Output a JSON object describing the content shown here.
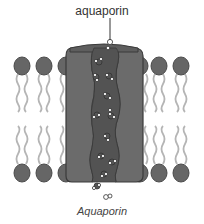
{
  "diagram": {
    "title_label": "aquaporin",
    "caption": "Aquaporin",
    "colors": {
      "protein": "#6b6b6b",
      "protein_outline": "#3a3a3a",
      "channel": "#555555",
      "lipid_head": "#666666",
      "lipid_tail": "#b5b5b5",
      "water_molecule": "#ffffff",
      "background": "#ffffff"
    },
    "components": [
      {
        "name": "lipid bilayer",
        "description": "phospholipid heads with wavy tails, upper and lower leaflets"
      },
      {
        "name": "aquaporin protein",
        "description": "transmembrane protein block with central water channel"
      },
      {
        "name": "water molecules",
        "description": "single-file water molecules passing through the channel"
      }
    ]
  }
}
